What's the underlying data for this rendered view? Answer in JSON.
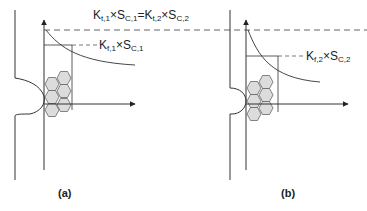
{
  "figure": {
    "top_label": {
      "text": "Kt,1×SC,1=Kt,2×SC,2",
      "k1": "K",
      "k1_sub": "t,1",
      "times1": "×",
      "s1": "S",
      "s1_sub": "C,1",
      "eq": "=",
      "k2": "K",
      "k2_sub": "t,2",
      "times2": "×",
      "s2": "S",
      "s2_sub": "C,2"
    },
    "panel_a": {
      "caption": "(a)",
      "label": {
        "text": "Kf,1×SC,1",
        "k": "K",
        "k_sub": "f,1",
        "times": "×",
        "s": "S",
        "s_sub": "C,1"
      },
      "notch": "sharp notch (large root radius profile)"
    },
    "panel_b": {
      "caption": "(b)",
      "label": {
        "text": "Kf,2×SC,2",
        "k": "K",
        "k_sub": "f,2",
        "times": "×",
        "s": "S",
        "s_sub": "C,2"
      },
      "notch": "small notch"
    },
    "colors": {
      "line": "#333333",
      "dashed": "#555555",
      "grain_fill": "#dcdcdc",
      "grain_stroke": "#666666"
    }
  }
}
